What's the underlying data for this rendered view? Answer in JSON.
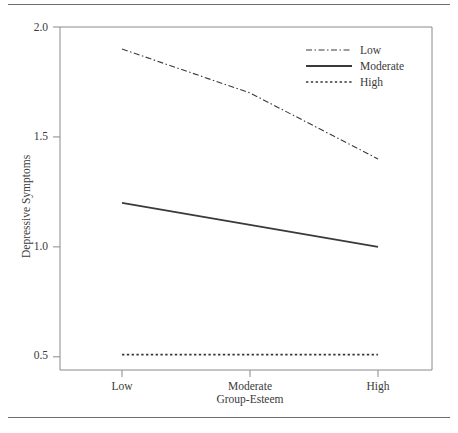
{
  "chart_data": {
    "type": "line",
    "title": "",
    "xlabel": "Group-Esteem",
    "ylabel": "Depressive Symptoms",
    "categories": [
      "Low",
      "Moderate",
      "High"
    ],
    "xtick_labels": [
      "Low",
      "Moderate",
      "High"
    ],
    "ytick_labels": [
      "2.0",
      "1.5",
      "1.0",
      "0.5"
    ],
    "ytick_values": [
      2.0,
      1.5,
      1.0,
      0.5
    ],
    "ylim": [
      0.44,
      2.0
    ],
    "grid": false,
    "legend_position": "top-right",
    "series": [
      {
        "name": "Low",
        "values": [
          1.9,
          1.7,
          1.4
        ],
        "style": "dash-dot",
        "color": "#3a3a3a"
      },
      {
        "name": "Moderate",
        "values": [
          1.2,
          1.1,
          1.0
        ],
        "style": "solid",
        "color": "#3a3a3a"
      },
      {
        "name": "High",
        "values": [
          0.51,
          0.51,
          0.51
        ],
        "style": "dotted",
        "color": "#3a3a3a"
      }
    ]
  },
  "axes": {
    "y_tick_0": "2.0",
    "y_tick_1": "1.5",
    "y_tick_2": "1.0",
    "y_tick_3": "0.5",
    "x_tick_0": "Low",
    "x_tick_1": "Moderate",
    "x_tick_2": "High",
    "x_axis_title": "Group-Esteem",
    "y_axis_title": "Depressive Symptoms"
  },
  "legend": {
    "items": [
      {
        "label": "Low"
      },
      {
        "label": "Moderate"
      },
      {
        "label": "High"
      }
    ]
  }
}
